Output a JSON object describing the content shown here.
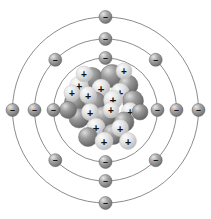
{
  "figure": {
    "name": "bohr-atomic-model",
    "title": "Bohr model of an atom",
    "width": 211,
    "height": 219,
    "background_color": "#ffffff",
    "center": {
      "x": 105.5,
      "y": 110
    }
  },
  "colors": {
    "background": "#ffffff",
    "orbit_line": "#6e6e6e",
    "electron_base": "#9a9a9a",
    "electron_dark": "#6d6d6d",
    "electron_highlight": "#e8e8e8",
    "electron_sign": "#1a1a1a",
    "neutron_base": "#8f8f8f",
    "neutron_dark": "#5f5f5f",
    "neutron_highlight": "#dcdcdc",
    "proton_base": "#e2e2e2",
    "proton_dark": "#b4b4b4",
    "proton_highlight": "#fbfbfb",
    "proton_sign": "#111111"
  },
  "nucleus": {
    "label": "nucleus",
    "proton_symbol": "+",
    "neutron_symbol": "",
    "proton_count": 14,
    "neutron_count": 14,
    "radius": 38,
    "particles": [
      {
        "type": "neutron",
        "x": 92,
        "y": 78,
        "r": 10.5
      },
      {
        "type": "neutron",
        "x": 112,
        "y": 76,
        "r": 11.5
      },
      {
        "type": "neutron",
        "x": 128,
        "y": 85,
        "r": 10.0
      },
      {
        "type": "proton",
        "x": 79,
        "y": 86,
        "r": 9.5
      },
      {
        "type": "proton",
        "x": 101,
        "y": 88,
        "r": 9.0
      },
      {
        "type": "proton",
        "x": 120,
        "y": 92,
        "r": 9.0
      },
      {
        "type": "neutron",
        "x": 75,
        "y": 102,
        "r": 10.5
      },
      {
        "type": "neutron",
        "x": 95,
        "y": 103,
        "r": 11.0
      },
      {
        "type": "neutron",
        "x": 133,
        "y": 101,
        "r": 10.5
      },
      {
        "type": "proton",
        "x": 88,
        "y": 95,
        "r": 8.5
      },
      {
        "type": "proton",
        "x": 113,
        "y": 100,
        "r": 9.5
      },
      {
        "type": "proton",
        "x": 130,
        "y": 111,
        "r": 8.5
      },
      {
        "type": "neutron",
        "x": 79,
        "y": 118,
        "r": 10.0
      },
      {
        "type": "neutron",
        "x": 104,
        "y": 117,
        "r": 11.0
      },
      {
        "type": "neutron",
        "x": 124,
        "y": 122,
        "r": 10.0
      },
      {
        "type": "proton",
        "x": 90,
        "y": 112,
        "r": 8.5
      },
      {
        "type": "proton",
        "x": 111,
        "y": 110,
        "r": 8.0
      },
      {
        "type": "proton",
        "x": 96,
        "y": 127,
        "r": 9.0
      },
      {
        "type": "neutron",
        "x": 113,
        "y": 134,
        "r": 10.5
      },
      {
        "type": "neutron",
        "x": 88,
        "y": 137,
        "r": 9.5
      },
      {
        "type": "proton",
        "x": 120,
        "y": 128,
        "r": 8.5
      },
      {
        "type": "proton",
        "x": 104,
        "y": 141,
        "r": 9.0
      },
      {
        "type": "proton",
        "x": 128,
        "y": 141,
        "r": 8.5
      },
      {
        "type": "neutron",
        "x": 68,
        "y": 110,
        "r": 8.5
      },
      {
        "type": "neutron",
        "x": 140,
        "y": 112,
        "r": 8.0
      },
      {
        "type": "proton",
        "x": 84,
        "y": 74,
        "r": 8.0
      },
      {
        "type": "proton",
        "x": 124,
        "y": 71,
        "r": 8.0
      },
      {
        "type": "proton",
        "x": 72,
        "y": 93,
        "r": 8.0
      }
    ]
  },
  "shells": [
    {
      "name": "shell-1",
      "label": "K shell",
      "radius": 52,
      "electron_count": 4,
      "electron_angles": [
        270,
        0,
        90,
        180
      ]
    },
    {
      "name": "shell-2",
      "label": "L shell",
      "radius": 71,
      "electron_count": 8,
      "electron_angles": [
        270,
        315,
        0,
        45,
        90,
        135,
        180,
        225
      ]
    },
    {
      "name": "shell-3",
      "label": "M shell",
      "radius": 93,
      "electron_count": 4,
      "electron_angles": [
        270,
        0,
        90,
        180
      ]
    }
  ],
  "electron": {
    "label": "electron",
    "symbol": "–",
    "radius": 6.5,
    "total_count": 16
  }
}
